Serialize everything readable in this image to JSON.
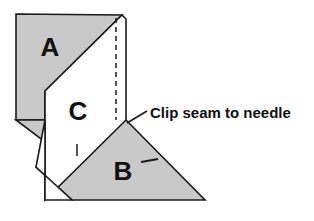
{
  "figure": {
    "kind": "sewing-fold-diagram",
    "background_color": "#ffffff",
    "outline_color": "#1a1a1a",
    "fabric_fill_gray": "#c9c9c9",
    "fabric_fill_white": "#ffffff",
    "text_color": "#111111"
  },
  "pieces": [
    {
      "id": "a",
      "label": "A",
      "fill": "#c9c9c9",
      "label_x": 50,
      "label_y": 49
    },
    {
      "id": "c",
      "label": "C",
      "fill": "#ffffff",
      "label_x": 78,
      "label_y": 113
    },
    {
      "id": "b",
      "label": "B",
      "fill": "#c9c9c9",
      "label_x": 123,
      "label_y": 173
    }
  ],
  "annotations": [
    {
      "id": "clip-seam",
      "text": "Clip seam to needle",
      "text_x": 150,
      "text_y": 114,
      "leader_from_x": 127,
      "leader_from_y": 123,
      "leader_to_x": 147,
      "leader_to_y": 111
    }
  ],
  "fold_line": {
    "id": "dashed-fold",
    "style": "dashed",
    "x": 116,
    "y_top": 18,
    "y_bottom": 120
  },
  "tick_marks": [
    {
      "id": "tick-c-edge",
      "x1": 77,
      "y1": 144,
      "x2": 77,
      "y2": 156
    },
    {
      "id": "tick-b-inner",
      "x1": 141,
      "y1": 162,
      "x2": 158,
      "y2": 159
    }
  ],
  "geometry": {
    "piece_a_path": "M 16 14 L 122 15 L 45 91 L 45 120 L 16 120 Z",
    "piece_a_flap_path": "M 16 120 L 45 120 L 45 142 Z",
    "piece_c_path": "M 122 15 L 126 19 L 126 120 L 45 200 L 45 91 Z",
    "piece_b_path": "M 126 120 L 205 200 L 72 200 L 36 167 L 60 152 Z",
    "piece_c_overlap_path": "M 45 120 L 45 200 L 72 200 L 36 167 Z"
  }
}
